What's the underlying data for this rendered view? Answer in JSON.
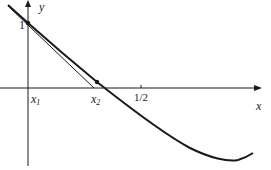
{
  "figure": {
    "type": "Newton's method illustration",
    "axes": {
      "x_label": "x",
      "y_label": "y"
    },
    "labels": {
      "y_intercept": "1",
      "x1": "x",
      "x1_sub": "1",
      "x2": "x",
      "x2_sub": "2",
      "half_tick": "1/2"
    },
    "elements": [
      "curve y = f(x) decreasing from (0,1), crossing x-axis just right of x2, minimum below axis to the right",
      "tangent line at (x1, 1) intersecting x-axis at x2",
      "point at (0, 1)",
      "point on curve above x2"
    ],
    "colors": {
      "ink": "#1a1a1a",
      "background": "#ffffff"
    }
  }
}
